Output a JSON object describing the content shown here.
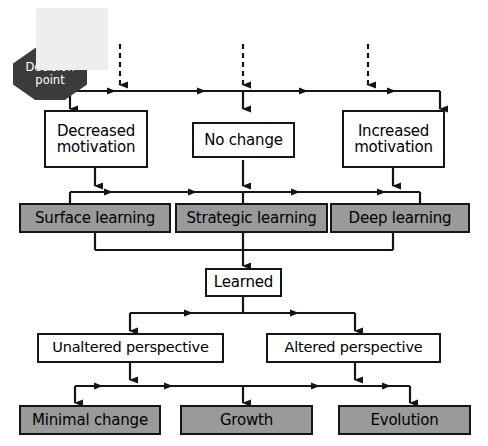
{
  "diagram": {
    "background_color": "#ffffff",
    "shaded_fill": "#9a9a9a",
    "decision_fill": "#3c3c3c",
    "line_color": "#151515",
    "overlay_color": "#eeeeee"
  },
  "decision": {
    "label": "Decision\npoint",
    "line1": "Decision",
    "line2": "point"
  },
  "inputs": {
    "arrow_style": "dashed",
    "count": 3,
    "labels": [
      "",
      "",
      ""
    ]
  },
  "row_motivation": {
    "nodes": [
      {
        "label": "Decreased\nmotivation",
        "shaded": false
      },
      {
        "label": "No change",
        "shaded": false
      },
      {
        "label": "Increased\nmotivation",
        "shaded": false
      }
    ]
  },
  "row_learning": {
    "nodes": [
      {
        "label": "Surface learning",
        "shaded": true
      },
      {
        "label": "Strategic learning",
        "shaded": true
      },
      {
        "label": "Deep learning",
        "shaded": true
      }
    ]
  },
  "row_learned": {
    "nodes": [
      {
        "label": "Learned",
        "shaded": false
      }
    ]
  },
  "row_perspective": {
    "nodes": [
      {
        "label": "Unaltered perspective",
        "shaded": false
      },
      {
        "label": "Altered perspective",
        "shaded": false
      }
    ]
  },
  "row_outcome": {
    "nodes": [
      {
        "label": "Minimal change",
        "shaded": true
      },
      {
        "label": "Growth",
        "shaded": true
      },
      {
        "label": "Evolution",
        "shaded": true
      }
    ]
  }
}
